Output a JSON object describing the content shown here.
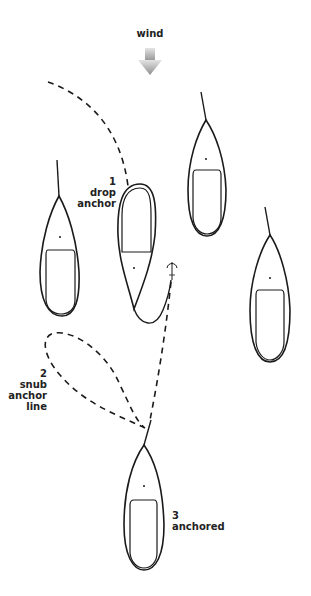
{
  "wind": {
    "label": "wind",
    "arrow_color_top": "#e0e0e0",
    "arrow_color_bottom": "#909090"
  },
  "steps": [
    {
      "number": "1",
      "lines": [
        "drop",
        "anchor"
      ]
    },
    {
      "number": "2",
      "lines": [
        "snub",
        "anchor",
        "line"
      ]
    },
    {
      "number": "3",
      "lines": [
        "anchored"
      ]
    }
  ],
  "colors": {
    "stroke": "#1a1a1a",
    "background": "#ffffff"
  }
}
